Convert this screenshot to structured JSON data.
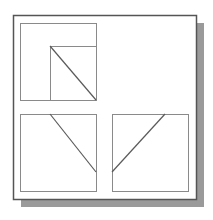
{
  "diagram": {
    "type": "orthographic-projection-views",
    "colors": {
      "background": "#ffffff",
      "frame_border": "#555555",
      "shadow": "#9a9a9a",
      "view_border": "#8a8a8a",
      "diagonal_line": "#5a5a5a"
    },
    "frame": {
      "x": 13,
      "y": 15,
      "width": 183,
      "height": 184
    },
    "shadow": {
      "offset_x": 8,
      "offset_y": 8
    },
    "views": [
      {
        "name": "top-view",
        "box": {
          "x": 20,
          "y": 23,
          "width": 76,
          "height": 77
        },
        "inner_rect": {
          "x": 50,
          "y": 46,
          "width": 46,
          "height": 54
        },
        "diagonal": {
          "x1": 50,
          "y1": 46,
          "x2": 96,
          "y2": 100
        }
      },
      {
        "name": "front-view",
        "box": {
          "x": 20,
          "y": 114,
          "width": 76,
          "height": 77
        },
        "diagonal": {
          "x1": 50,
          "y1": 114,
          "x2": 96,
          "y2": 172
        }
      },
      {
        "name": "side-view",
        "box": {
          "x": 112,
          "y": 114,
          "width": 76,
          "height": 77
        },
        "diagonal": {
          "x1": 165,
          "y1": 114,
          "x2": 112,
          "y2": 172
        }
      }
    ]
  }
}
